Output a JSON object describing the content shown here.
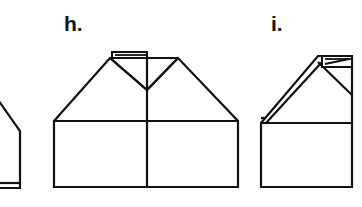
{
  "figure": {
    "kind": "line-drawing",
    "background_color": "#ffffff",
    "stroke_color": "#111111",
    "fill_color": "#ffffff",
    "stroke_width": 2.2,
    "width": 362,
    "height": 207
  },
  "labels": [
    {
      "id": "h",
      "text": "h.",
      "x": 64,
      "y": 13
    },
    {
      "id": "i",
      "text": "i.",
      "x": 271,
      "y": 13
    }
  ],
  "shapes": {
    "partial_left": {
      "name": "partial-house-left",
      "description": "house shape cropped by the left edge of the image, showing a sloping roof, right wall and base",
      "paths": [
        "M -6 94 L 20 131 L 20 188 L -6 188",
        "M -6 183 L 20 183"
      ]
    },
    "house_h": {
      "name": "house-h",
      "description": "symmetric double-gable house with central valley fold, divided rectangular body and a small folded tab at the ridge",
      "outline": "M 54 121 L 110 58 L 147 90 L 178 58 L 238 121 L 238 187 L 54 187 Z",
      "eave_line": "M 54 121 L 238 121",
      "ridge_line": "M 110 58 L 178 58",
      "center_line": "M 147 58 L 147 187",
      "valley_left": "M 110 58 L 147 90",
      "valley_right": "M 178 58 L 147 90",
      "tab": "M 112 53 L 147 53 L 147 58 L 112 58 Z",
      "tab_inner": "M 114 55 L 147 55"
    },
    "house_i": {
      "name": "house-i",
      "description": "half house with a single long sloping roof folded back as a double line, a small folded tab at the apex and a rectangular body",
      "outline": "M 261 123 L 318 56 L 352 56 L 352 187 L 261 187 Z",
      "eave_line": "M 261 123 L 352 123",
      "fold_outer": "M 261 123 L 318 56",
      "fold_inner": "M 266 123 L 322 62",
      "fold_cap": "M 261 118 L 266 118",
      "valley": "M 318 62 L 352 95",
      "apex_vertical": "M 322 62 L 322 70",
      "tab": "M 322 56 L 352 56 L 352 66 L 322 66 Z",
      "tab_inner_a": "M 325 60 L 350 60",
      "tab_inner_b": "M 326 63 L 348 58"
    }
  }
}
